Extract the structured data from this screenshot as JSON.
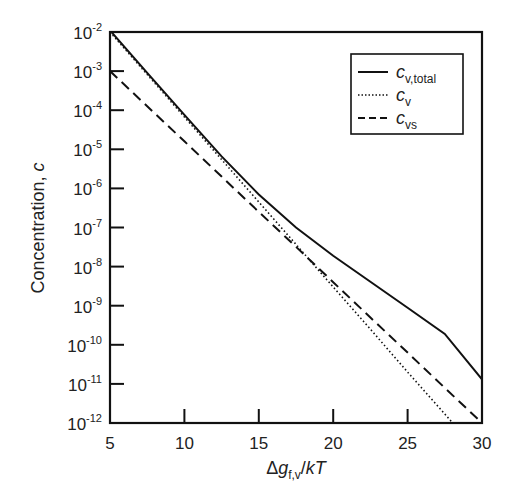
{
  "chart_data": {
    "type": "line",
    "title": "",
    "xlabel": "Δg_f,v/kT",
    "ylabel": "Concentration, c",
    "xlim": [
      5,
      30
    ],
    "ylim": [
      1e-12,
      0.01
    ],
    "yscale": "log",
    "grid": false,
    "legend_position": "upper right",
    "x_ticks": [
      5,
      10,
      15,
      20,
      25,
      30
    ],
    "y_ticks": [
      "10^-2",
      "10^-3",
      "10^-4",
      "10^-5",
      "10^-6",
      "10^-7",
      "10^-8",
      "10^-9",
      "10^-10",
      "10^-11",
      "10^-12"
    ],
    "x": [
      5,
      7.5,
      10,
      12.5,
      15,
      17.5,
      20,
      22.5,
      25,
      27.5,
      30
    ],
    "series": [
      {
        "name": "c_v,total",
        "style": "solid",
        "values": [
          0.011,
          0.0009,
          7.6e-05,
          6.6e-06,
          7e-07,
          1e-07,
          1.9e-08,
          4.1e-09,
          8.9e-10,
          1.9e-10,
          1.3e-11
        ]
      },
      {
        "name": "c_v",
        "style": "dotted",
        "values": [
          0.01,
          0.00082,
          6.7e-05,
          5.5e-06,
          4.5e-07,
          3.7e-08,
          3e-09,
          2.5e-10,
          2e-11,
          1.7e-12,
          1.4e-13
        ]
      },
      {
        "name": "c_vs",
        "style": "dashed",
        "values": [
          0.001,
          0.000126,
          1.6e-05,
          2e-06,
          2.5e-07,
          3.2e-08,
          4e-09,
          5e-10,
          6.3e-11,
          7.9e-12,
          1e-12
        ]
      }
    ]
  },
  "axes": {
    "x_tick_labels": [
      "5",
      "10",
      "15",
      "20",
      "25",
      "30"
    ],
    "y_tick_exponents": [
      "-2",
      "-3",
      "-4",
      "-5",
      "-6",
      "-7",
      "-8",
      "-9",
      "-10",
      "-11",
      "-12"
    ],
    "y_tick_base": "10",
    "xlabel_parts": {
      "delta": "Δ",
      "g": "g",
      "sub": "f,v",
      "rest_slash": "/",
      "k": "k",
      "T": "T"
    },
    "ylabel_text": "Concentration, ",
    "ylabel_var": "c"
  },
  "legend": {
    "items": [
      {
        "var": "c",
        "sub": "v,total",
        "style": "solid"
      },
      {
        "var": "c",
        "sub": "v",
        "style": "dotted"
      },
      {
        "var": "c",
        "sub": "vs",
        "style": "dashed"
      }
    ]
  }
}
